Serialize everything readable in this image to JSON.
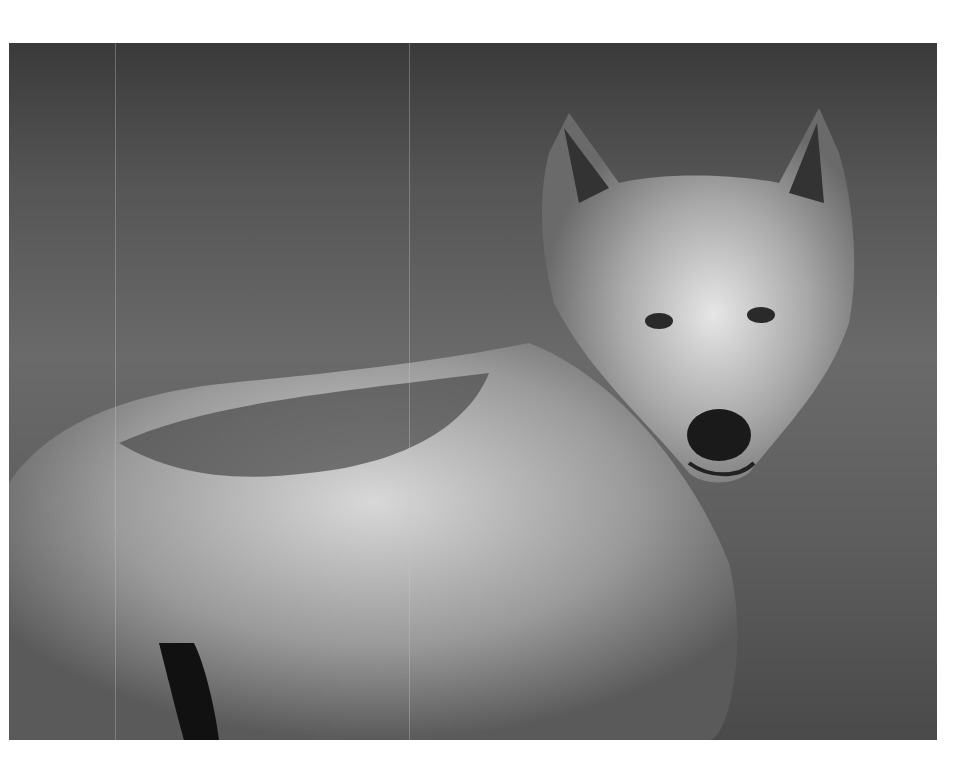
{
  "image": {
    "subject": "Gray wolf portrait, black and white photo",
    "alt": "Black and white photograph of a wet gray wolf standing in profile, head turned toward the camera"
  }
}
